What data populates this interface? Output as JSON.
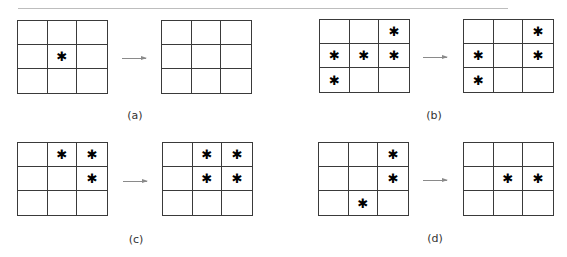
{
  "panels": [
    {
      "label": "(a)",
      "before": [
        [
          0,
          0,
          0
        ],
        [
          0,
          1,
          0
        ],
        [
          0,
          0,
          0
        ]
      ],
      "after": [
        [
          0,
          0,
          0
        ],
        [
          0,
          0,
          0
        ],
        [
          0,
          0,
          0
        ]
      ]
    },
    {
      "label": "(b)",
      "before": [
        [
          0,
          0,
          1
        ],
        [
          1,
          1,
          1
        ],
        [
          1,
          0,
          0
        ]
      ],
      "after": [
        [
          0,
          0,
          1
        ],
        [
          1,
          0,
          1
        ],
        [
          1,
          0,
          0
        ]
      ]
    },
    {
      "label": "(c)",
      "before": [
        [
          0,
          1,
          1
        ],
        [
          0,
          0,
          1
        ],
        [
          0,
          0,
          0
        ]
      ],
      "after": [
        [
          0,
          1,
          1
        ],
        [
          0,
          1,
          1
        ],
        [
          0,
          0,
          0
        ]
      ]
    },
    {
      "label": "(d)",
      "before": [
        [
          0,
          0,
          1
        ],
        [
          0,
          0,
          1
        ],
        [
          0,
          1,
          0
        ]
      ],
      "after": [
        [
          0,
          0,
          0
        ],
        [
          0,
          1,
          1
        ],
        [
          0,
          0,
          0
        ]
      ]
    }
  ],
  "mark_glyph": "✱",
  "colors": {
    "grid_line": "#3a3a3a",
    "arrow": "#8a8a8a",
    "rule": "#bdbdbd"
  }
}
